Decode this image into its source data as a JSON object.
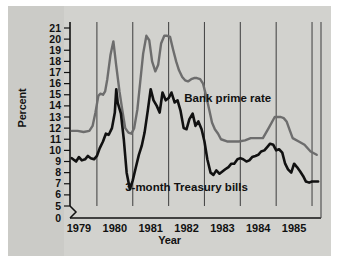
{
  "chart_data": {
    "type": "line",
    "title": "",
    "xlabel": "Year",
    "ylabel": "Percent",
    "xlim": [
      1978.75,
      1985.75
    ],
    "ylim": [
      5,
      21
    ],
    "y_axis_break": true,
    "y_break_from": 0,
    "y_break_to": 5,
    "grid": "vertical-yearly",
    "legend_position": "inline-annotations",
    "ytick_labels": [
      "21",
      "20",
      "19",
      "18",
      "17",
      "16",
      "15",
      "14",
      "13",
      "12",
      "11",
      "10",
      "9",
      "8",
      "7",
      "6",
      "5",
      "0"
    ],
    "yticks": [
      21,
      20,
      19,
      18,
      17,
      16,
      15,
      14,
      13,
      12,
      11,
      10,
      9,
      8,
      7,
      6,
      5,
      0
    ],
    "xtick_labels": [
      "1979",
      "1980",
      "1981",
      "1982",
      "1983",
      "1984",
      "1985"
    ],
    "xticks": [
      1979,
      1980,
      1981,
      1982,
      1983,
      1984,
      1985
    ],
    "gridline_years": [
      1979.5,
      1980.5,
      1981.5,
      1982.5,
      1983.5,
      1984.5,
      1985.5
    ],
    "series": [
      {
        "name": "Bank prime rate",
        "color": "#6d6d6d",
        "label_x": 1983.15,
        "label_y": 14.35,
        "x": [
          1978.8,
          1978.96,
          1979.13,
          1979.29,
          1979.38,
          1979.46,
          1979.54,
          1979.6,
          1979.67,
          1979.73,
          1979.79,
          1979.88,
          1979.96,
          1980.04,
          1980.13,
          1980.21,
          1980.29,
          1980.38,
          1980.46,
          1980.54,
          1980.63,
          1980.71,
          1980.79,
          1980.88,
          1980.96,
          1981.04,
          1981.13,
          1981.21,
          1981.29,
          1981.38,
          1981.46,
          1981.54,
          1981.63,
          1981.71,
          1981.79,
          1981.88,
          1981.96,
          1982.04,
          1982.13,
          1982.21,
          1982.29,
          1982.38,
          1982.46,
          1982.54,
          1982.63,
          1982.71,
          1982.79,
          1982.88,
          1982.96,
          1983.13,
          1983.29,
          1983.46,
          1983.63,
          1983.79,
          1983.96,
          1984.13,
          1984.29,
          1984.46,
          1984.54,
          1984.63,
          1984.71,
          1984.79,
          1984.88,
          1984.96,
          1985.13,
          1985.29,
          1985.46,
          1985.63
        ],
        "y": [
          11.75,
          11.75,
          11.65,
          11.75,
          12.2,
          13.4,
          14.9,
          15.1,
          15.0,
          15.3,
          16.4,
          18.6,
          19.8,
          17.6,
          15.3,
          13.6,
          12.0,
          11.6,
          11.5,
          12.0,
          13.7,
          16.2,
          18.7,
          20.3,
          19.9,
          18.0,
          17.1,
          17.7,
          19.6,
          20.3,
          20.3,
          20.2,
          19.0,
          18.0,
          17.2,
          16.6,
          16.3,
          16.2,
          16.4,
          16.5,
          16.5,
          16.4,
          16.0,
          15.0,
          13.7,
          12.5,
          11.9,
          11.5,
          11.0,
          10.8,
          10.8,
          10.8,
          10.9,
          11.1,
          11.1,
          11.1,
          12.0,
          13.0,
          13.0,
          13.0,
          12.9,
          12.6,
          11.8,
          11.1,
          10.8,
          10.5,
          9.9,
          9.6
        ]
      },
      {
        "name": "3-month Treasury bills",
        "color": "#111111",
        "label_x": 1982.0,
        "label_y": 6.35,
        "x": [
          1978.8,
          1978.92,
          1979.0,
          1979.08,
          1979.17,
          1979.25,
          1979.33,
          1979.42,
          1979.5,
          1979.58,
          1979.67,
          1979.75,
          1979.83,
          1979.92,
          1980.0,
          1980.04,
          1980.08,
          1980.17,
          1980.25,
          1980.33,
          1980.42,
          1980.5,
          1980.58,
          1980.67,
          1980.75,
          1980.83,
          1980.92,
          1981.0,
          1981.08,
          1981.17,
          1981.25,
          1981.33,
          1981.42,
          1981.5,
          1981.58,
          1981.67,
          1981.75,
          1981.83,
          1981.92,
          1982.0,
          1982.08,
          1982.17,
          1982.25,
          1982.33,
          1982.42,
          1982.5,
          1982.58,
          1982.67,
          1982.75,
          1982.83,
          1982.92,
          1983.0,
          1983.08,
          1983.17,
          1983.25,
          1983.33,
          1983.42,
          1983.5,
          1983.58,
          1983.67,
          1983.75,
          1983.83,
          1983.92,
          1984.0,
          1984.08,
          1984.17,
          1984.25,
          1984.33,
          1984.42,
          1984.5,
          1984.58,
          1984.67,
          1984.75,
          1984.83,
          1984.92,
          1985.0,
          1985.08,
          1985.17,
          1985.25,
          1985.33,
          1985.42,
          1985.5,
          1985.58,
          1985.67
        ],
        "y": [
          9.3,
          9.0,
          9.4,
          9.1,
          9.2,
          9.5,
          9.3,
          9.2,
          9.5,
          10.2,
          10.8,
          11.5,
          11.4,
          12.0,
          13.4,
          15.5,
          14.3,
          13.3,
          11.0,
          8.0,
          6.5,
          7.3,
          8.4,
          9.6,
          10.4,
          11.6,
          13.6,
          15.5,
          14.5,
          14.0,
          13.4,
          15.2,
          14.5,
          14.7,
          15.2,
          14.3,
          14.5,
          13.6,
          12.0,
          11.9,
          12.8,
          13.3,
          12.2,
          12.6,
          11.9,
          10.8,
          9.2,
          8.0,
          7.8,
          8.2,
          7.9,
          8.1,
          8.3,
          8.5,
          8.8,
          8.8,
          9.2,
          9.3,
          9.2,
          9.0,
          9.1,
          9.4,
          9.5,
          9.6,
          9.9,
          10.0,
          10.3,
          10.6,
          10.5,
          10.0,
          10.1,
          9.8,
          8.8,
          8.3,
          8.0,
          8.8,
          8.5,
          8.1,
          7.7,
          7.2,
          7.1,
          7.2,
          7.2,
          7.2
        ]
      }
    ]
  }
}
